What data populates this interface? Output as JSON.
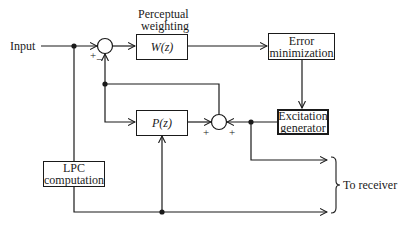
{
  "diagram": {
    "input_label": "Input",
    "perceptual_label_line1": "Perceptual",
    "perceptual_label_line2": "weighting",
    "blocks": {
      "w": "W(z)",
      "error_line1": "Error",
      "error_line2": "minimization",
      "excitation_line1": "Excitation",
      "excitation_line2": "generator",
      "p": "P(z)",
      "lpc_line1": "LPC",
      "lpc_line2": "computation"
    },
    "summer1_signs": {
      "plus": "+",
      "minus": "−"
    },
    "summer2_signs": {
      "left": "+",
      "right": "+"
    },
    "output_label": "To receiver",
    "line_color": "#1a1a1a"
  }
}
